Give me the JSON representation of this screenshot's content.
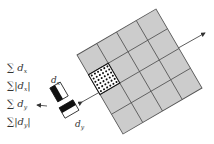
{
  "diagram": {
    "type": "surf-descriptor",
    "grid": {
      "rows": 4,
      "cols": 4,
      "fill": "#cccccc",
      "stroke": "#555555",
      "highlighted_cell": {
        "row": 2,
        "col": 0
      },
      "dot_grid": "6x6"
    },
    "features": [
      {
        "sum": "∑",
        "open": "",
        "var": "d",
        "sub": "x",
        "close": ""
      },
      {
        "sum": "∑",
        "open": "|",
        "var": "d",
        "sub": "x",
        "close": "|"
      },
      {
        "sum": "∑",
        "open": "",
        "var": "d",
        "sub": "y",
        "close": ""
      },
      {
        "sum": "∑",
        "open": "|",
        "var": "d",
        "sub": "y",
        "close": "|"
      }
    ],
    "wavelets": {
      "dx": {
        "var": "d",
        "sub": "x"
      },
      "dy": {
        "var": "d",
        "sub": "y"
      }
    }
  }
}
